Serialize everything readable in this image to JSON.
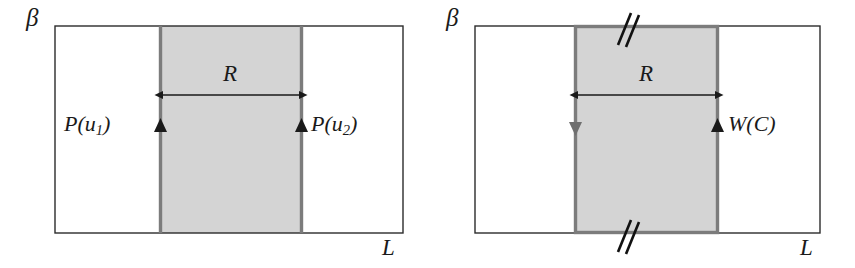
{
  "figure": {
    "type": "diagram",
    "background_color": "#ffffff",
    "shaded_fill": "#d4d4d4",
    "band_border_color": "#808080",
    "outline_color": "#2b2b2b",
    "arrow_color": "#1a1a1a"
  },
  "panels": [
    {
      "id": "left-panel",
      "labels": {
        "vertical_axis": "β",
        "horizontal_axis": "L",
        "width_label": "R",
        "left_line_label_base": "P(u",
        "left_line_label_sub": "1",
        "left_line_label_close": ")",
        "right_line_label_base": "P(u",
        "right_line_label_sub": "2",
        "right_line_label_close": ")"
      },
      "markers": {
        "left_arrow": "up-triangle",
        "right_arrow": "up-triangle"
      },
      "geometry": {
        "rect_x": 55,
        "rect_y": 26,
        "rect_w": 348,
        "rect_h": 207,
        "band_x": 160,
        "band_w": 142,
        "measure_y": 95
      }
    },
    {
      "id": "right-panel",
      "labels": {
        "vertical_axis": "β",
        "horizontal_axis": "L",
        "width_label": "R",
        "right_line_label": "W(C)"
      },
      "markers": {
        "left_arrow": "down-triangle",
        "right_arrow": "up-triangle",
        "top_hatch": "double-slash",
        "bottom_hatch": "double-slash"
      },
      "geometry": {
        "rect_x": 475,
        "rect_y": 26,
        "rect_w": 345,
        "rect_h": 207,
        "band_x": 575,
        "band_w": 143,
        "measure_y": 95
      }
    }
  ]
}
